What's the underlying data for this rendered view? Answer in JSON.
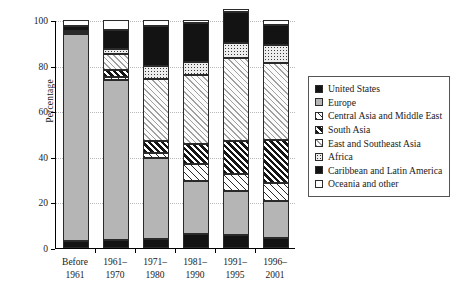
{
  "chart_data": {
    "type": "bar",
    "stacked": true,
    "title": "",
    "xlabel": "",
    "ylabel": "Percentage",
    "ylim": [
      0,
      100
    ],
    "yticks": [
      0,
      20,
      40,
      60,
      80,
      100
    ],
    "grid": true,
    "legend_position": "right",
    "categories": [
      "Before\n1961",
      "1961–\n1970",
      "1971–\n1980",
      "1981–\n1990",
      "1991–\n1995",
      "1996–\n2001"
    ],
    "category_lines": [
      [
        "Before",
        "1961"
      ],
      [
        "1961–",
        "1970"
      ],
      [
        "1971–",
        "1980"
      ],
      [
        "1981–",
        "1990"
      ],
      [
        "1991–",
        "1995"
      ],
      [
        "1996–",
        "2001"
      ]
    ],
    "series": [
      {
        "name": "United States",
        "pattern": "solid-black",
        "swatch": "p-solid-black",
        "values": [
          3.2,
          3.5,
          4.0,
          6.0,
          5.5,
          4.5
        ]
      },
      {
        "name": "Europe",
        "pattern": "solid-grey",
        "swatch": "p-grey",
        "values": [
          90.5,
          70.0,
          35.5,
          23.5,
          19.5,
          16.0
        ]
      },
      {
        "name": "Central Asia and Middle East",
        "pattern": "light-hatch",
        "swatch": "p-hatch-light",
        "values": [
          0.0,
          1.5,
          2.0,
          7.5,
          7.5,
          8.0
        ]
      },
      {
        "name": "South Asia",
        "pattern": "heavy-hatch",
        "swatch": "p-hatch-heavy",
        "values": [
          0.0,
          3.0,
          5.5,
          8.5,
          14.5,
          19.0
        ]
      },
      {
        "name": "East and Southeast Asia",
        "pattern": "pale-hatch",
        "swatch": "p-hatch-pale",
        "values": [
          1.0,
          7.0,
          27.0,
          30.5,
          36.5,
          33.5
        ]
      },
      {
        "name": "Africa",
        "pattern": "dots",
        "swatch": "p-dots",
        "values": [
          0.6,
          2.5,
          6.0,
          5.5,
          6.5,
          8.0
        ]
      },
      {
        "name": "Caribbean and Latin America",
        "pattern": "solid-black",
        "swatch": "p-solid-black",
        "values": [
          2.2,
          8.0,
          17.5,
          17.0,
          13.5,
          9.0
        ]
      },
      {
        "name": "Oceania and other",
        "pattern": "white",
        "swatch": "p-white",
        "values": [
          2.5,
          4.5,
          2.5,
          1.5,
          1.5,
          2.0
        ]
      }
    ]
  }
}
